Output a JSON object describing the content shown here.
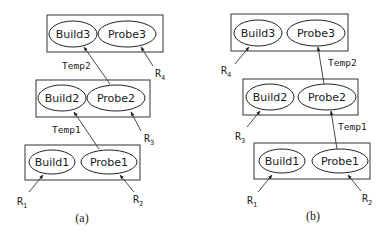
{
  "diagrams": [
    {
      "id": "a",
      "caption": "(a)",
      "stages": [
        {
          "build": "Build3",
          "probe": "Probe3"
        },
        {
          "build": "Build2",
          "probe": "Probe2"
        },
        {
          "build": "Build1",
          "probe": "Probe1"
        }
      ],
      "edges": {
        "temp2": "Temp2",
        "temp1": "Temp1"
      },
      "relations": {
        "r1": {
          "base": "R",
          "sub": "1"
        },
        "r2": {
          "base": "R",
          "sub": "2"
        },
        "r3": {
          "base": "R",
          "sub": "3"
        },
        "r4": {
          "base": "R",
          "sub": "4"
        }
      }
    },
    {
      "id": "b",
      "caption": "(b)",
      "stages": [
        {
          "build": "Build3",
          "probe": "Probe3"
        },
        {
          "build": "Build2",
          "probe": "Probe2"
        },
        {
          "build": "Build1",
          "probe": "Probe1"
        }
      ],
      "edges": {
        "temp2": "Temp2",
        "temp1": "Temp1"
      },
      "relations": {
        "r1": {
          "base": "R",
          "sub": "1"
        },
        "r2": {
          "base": "R",
          "sub": "2"
        },
        "r3": {
          "base": "R",
          "sub": "3"
        },
        "r4": {
          "base": "R",
          "sub": "4"
        }
      }
    }
  ]
}
